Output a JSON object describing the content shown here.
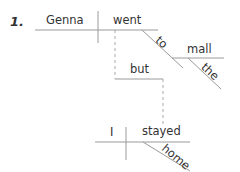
{
  "diagram": {
    "item_number": "1.",
    "words": {
      "subject1": "Genna",
      "verb1": "went",
      "prep1": "to",
      "object1": "mall",
      "article1": "the",
      "conjunction": "but",
      "subject2": "I",
      "verb2": "stayed",
      "adverb2": "home"
    },
    "line_color": "#999999"
  }
}
